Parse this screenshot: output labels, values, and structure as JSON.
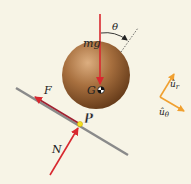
{
  "diagram": {
    "labels": {
      "weight": "mg",
      "angle": "θ",
      "center_of_mass": "G",
      "friction": "F",
      "contact_point": "P",
      "normal": "N",
      "unit_r_hat": "û",
      "unit_r_sub": "r",
      "unit_theta_hat": "û",
      "unit_theta_sub": "θ"
    },
    "colors": {
      "background": "#f7f4e6",
      "force_arrow": "#d8282f",
      "incline": "#8a8a8a",
      "unit_vector": "#f0a030",
      "sphere_light": "#d9a878",
      "sphere_dark": "#6b3f1c",
      "contact_point": "#f5e020"
    }
  }
}
